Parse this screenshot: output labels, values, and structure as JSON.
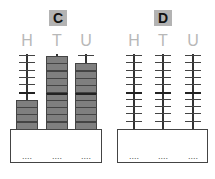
{
  "abaci": [
    {
      "label": "C",
      "columns": [
        {
          "heading": "H",
          "beads": 4,
          "placeholder": "...."
        },
        {
          "heading": "T",
          "beads": 10,
          "placeholder": "...."
        },
        {
          "heading": "U",
          "beads": 9,
          "placeholder": "...."
        }
      ]
    },
    {
      "label": "D",
      "columns": [
        {
          "heading": "H",
          "beads": 0,
          "placeholder": "...."
        },
        {
          "heading": "T",
          "beads": 0,
          "placeholder": "...."
        },
        {
          "heading": "U",
          "beads": 0,
          "placeholder": "...."
        }
      ]
    }
  ],
  "rod_capacity": 10,
  "colors": {
    "bead": "#7f7f7f",
    "label_bg": "#b3b3b3",
    "heading": "#b8b8b8"
  }
}
